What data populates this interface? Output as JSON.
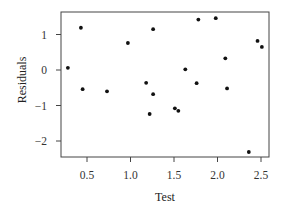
{
  "chart_data": {
    "type": "scatter",
    "title": "",
    "xlabel": "Test",
    "ylabel": "Residuals",
    "xlim": [
      0.2,
      2.6
    ],
    "ylim": [
      -2.45,
      1.65
    ],
    "xticks": [
      0.5,
      1.0,
      1.5,
      2.0,
      2.5
    ],
    "xtick_labels": [
      "0.5",
      "1.0",
      "1.5",
      "2.0",
      "2.5"
    ],
    "yticks": [
      -2,
      -1,
      0,
      1
    ],
    "ytick_labels": [
      "−2",
      "−1",
      "0",
      "1"
    ],
    "grid": false,
    "legend": null,
    "series": [
      {
        "name": "residuals",
        "color": "#111111",
        "points": [
          {
            "x": 0.28,
            "y": 0.06
          },
          {
            "x": 0.43,
            "y": 1.19
          },
          {
            "x": 0.45,
            "y": -0.54
          },
          {
            "x": 0.73,
            "y": -0.6
          },
          {
            "x": 0.97,
            "y": 0.76
          },
          {
            "x": 1.18,
            "y": -0.36
          },
          {
            "x": 1.22,
            "y": -1.24
          },
          {
            "x": 1.26,
            "y": 1.15
          },
          {
            "x": 1.26,
            "y": -0.68
          },
          {
            "x": 1.51,
            "y": -1.08
          },
          {
            "x": 1.55,
            "y": -1.15
          },
          {
            "x": 1.63,
            "y": 0.02
          },
          {
            "x": 1.76,
            "y": -0.37
          },
          {
            "x": 1.78,
            "y": 1.42
          },
          {
            "x": 1.98,
            "y": 1.46
          },
          {
            "x": 2.09,
            "y": 0.33
          },
          {
            "x": 2.11,
            "y": -0.52
          },
          {
            "x": 2.36,
            "y": -2.31
          },
          {
            "x": 2.46,
            "y": 0.82
          },
          {
            "x": 2.51,
            "y": 0.65
          }
        ]
      }
    ]
  }
}
